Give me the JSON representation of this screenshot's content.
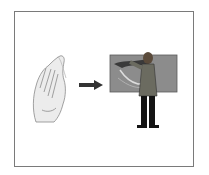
{
  "figure": {
    "panels": [
      {
        "name": "hand",
        "icon": "hand-sign-icon"
      },
      {
        "name": "arrow",
        "icon": "arrow-right-icon",
        "color": "#333333"
      },
      {
        "name": "presenter",
        "icon": "person-at-board-icon"
      }
    ],
    "colors": {
      "border": "#7a7a7a",
      "board": "#8c8c8c",
      "figure_dark": "#1a1a1a"
    }
  }
}
